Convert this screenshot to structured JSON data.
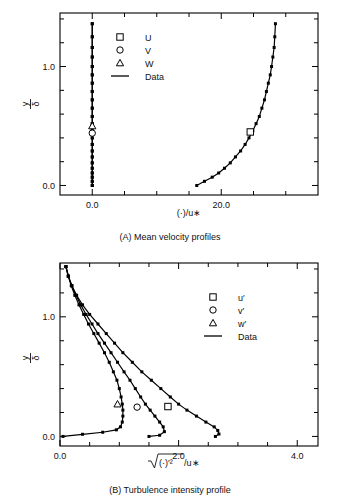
{
  "figure": {
    "background": "#ffffff",
    "ink": "#000000",
    "width": 340,
    "height": 503
  },
  "panels": [
    {
      "id": "A",
      "caption": "(A) Mean velocity profiles",
      "legend": [
        {
          "marker": "square",
          "label": "U"
        },
        {
          "marker": "circle",
          "label": "V"
        },
        {
          "marker": "triangle",
          "label": "W"
        },
        {
          "marker": "line",
          "label": "Data"
        }
      ],
      "chart_data": {
        "type": "line",
        "title": "(A) Mean velocity profiles",
        "xlabel": "(·)/u∗",
        "ylabel_num": "y",
        "ylabel_den": "δ",
        "xlim": [
          -5.0,
          35.0
        ],
        "ylim": [
          -0.08,
          1.45
        ],
        "xticks": [
          0.0,
          20.0
        ],
        "xticklabels": [
          "0.0",
          "20.0"
        ],
        "xminorticks": [
          5.0,
          10.0,
          15.0,
          25.0,
          30.0
        ],
        "yticks": [
          0.0,
          1.0
        ],
        "yticklabels": [
          "0.0",
          "1.0"
        ],
        "yminorticks": [
          0.2,
          0.4,
          0.6,
          0.8,
          1.2,
          1.4
        ],
        "grid": false,
        "legend_position": "upper-left-inside",
        "series": [
          {
            "name": "U",
            "marker": "square",
            "x": [
              16.2,
              17.4,
              18.6,
              19.6,
              20.5,
              21.4,
              22.2,
              23.0,
              23.7,
              24.3,
              24.9,
              25.4,
              25.9,
              26.3,
              26.7,
              27.0,
              27.3,
              27.6,
              27.8,
              28.0,
              28.2,
              28.3,
              28.4
            ],
            "y": [
              0.0,
              0.035,
              0.07,
              0.105,
              0.145,
              0.19,
              0.24,
              0.29,
              0.345,
              0.4,
              0.46,
              0.52,
              0.58,
              0.65,
              0.72,
              0.79,
              0.86,
              0.93,
              1.0,
              1.08,
              1.16,
              1.25,
              1.36
            ]
          },
          {
            "name": "V",
            "marker": "circle",
            "x": [
              0.0,
              0.0,
              0.0,
              0.0,
              0.0,
              0.0,
              0.0,
              0.0,
              0.0,
              0.0,
              0.0,
              0.0,
              0.0,
              0.0,
              0.0,
              0.0,
              0.0,
              0.0,
              0.0,
              0.0,
              0.0,
              0.0,
              0.0
            ],
            "y": [
              0.0,
              0.035,
              0.07,
              0.105,
              0.145,
              0.19,
              0.24,
              0.29,
              0.345,
              0.4,
              0.46,
              0.52,
              0.58,
              0.65,
              0.72,
              0.79,
              0.86,
              0.93,
              1.0,
              1.08,
              1.16,
              1.25,
              1.36
            ]
          },
          {
            "name": "W",
            "marker": "triangle",
            "x": [
              0.0,
              0.0,
              0.0,
              0.0,
              0.0,
              0.0,
              0.0,
              0.0,
              0.0,
              0.0,
              0.0,
              0.0,
              0.0,
              0.0,
              0.0,
              0.0,
              0.0,
              0.0,
              0.0,
              0.0,
              0.0,
              0.0,
              0.0
            ],
            "y": [
              0.0,
              0.035,
              0.07,
              0.105,
              0.145,
              0.19,
              0.24,
              0.29,
              0.345,
              0.4,
              0.46,
              0.52,
              0.58,
              0.65,
              0.72,
              0.79,
              0.86,
              0.93,
              1.0,
              1.08,
              1.16,
              1.25,
              1.36
            ]
          }
        ],
        "open_markers": [
          {
            "series": "U",
            "x": 24.5,
            "y": 0.45,
            "marker": "square"
          },
          {
            "series": "W",
            "x": 0.0,
            "y": 0.5,
            "marker": "triangle"
          },
          {
            "series": "V",
            "x": 0.0,
            "y": 0.44,
            "marker": "circle"
          }
        ]
      }
    },
    {
      "id": "B",
      "caption": "(B) Turbulence intensity profile",
      "legend": [
        {
          "marker": "square",
          "label": "u′"
        },
        {
          "marker": "circle",
          "label": "v′"
        },
        {
          "marker": "triangle",
          "label": "w′"
        },
        {
          "marker": "line",
          "label": "Data"
        }
      ],
      "chart_data": {
        "type": "line",
        "title": "(B) Turbulence intensity profile",
        "xlabel": "√(·)′²/u∗",
        "ylabel_num": "y",
        "ylabel_den": "δ",
        "xlim": [
          0.0,
          4.35
        ],
        "ylim": [
          -0.08,
          1.45
        ],
        "xticks": [
          0.0,
          2.0,
          4.0
        ],
        "xticklabels": [
          "0.0",
          "2.0",
          "4.0"
        ],
        "xminorticks": [
          0.5,
          1.0,
          1.5,
          2.5,
          3.0,
          3.5
        ],
        "yticks": [
          0.0,
          1.0
        ],
        "yticklabels": [
          "0.0",
          "1.0"
        ],
        "yminorticks": [
          0.2,
          0.4,
          0.6,
          0.8,
          1.2,
          1.4
        ],
        "grid": false,
        "legend_position": "upper-right-inside",
        "series": [
          {
            "name": "u′",
            "marker": "square",
            "x": [
              0.1,
              0.14,
              0.2,
              0.28,
              0.38,
              0.5,
              0.64,
              0.78,
              0.92,
              1.06,
              1.22,
              1.38,
              1.54,
              1.7,
              1.86,
              2.0,
              2.14,
              2.3,
              2.46,
              2.6,
              2.66,
              2.68,
              2.62
            ],
            "y": [
              1.42,
              1.34,
              1.26,
              1.18,
              1.1,
              1.02,
              0.94,
              0.86,
              0.78,
              0.7,
              0.62,
              0.54,
              0.47,
              0.4,
              0.33,
              0.27,
              0.22,
              0.17,
              0.12,
              0.08,
              0.05,
              0.02,
              0.0
            ]
          },
          {
            "name": "v′",
            "marker": "circle",
            "x": [
              0.1,
              0.14,
              0.2,
              0.27,
              0.35,
              0.44,
              0.54,
              0.64,
              0.75,
              0.86,
              0.97,
              1.08,
              1.18,
              1.27,
              1.36,
              1.44,
              1.52,
              1.6,
              1.68,
              1.74,
              1.76,
              1.68,
              1.5
            ],
            "y": [
              1.42,
              1.34,
              1.26,
              1.18,
              1.1,
              1.02,
              0.94,
              0.86,
              0.78,
              0.7,
              0.62,
              0.54,
              0.47,
              0.4,
              0.33,
              0.27,
              0.22,
              0.17,
              0.12,
              0.08,
              0.04,
              0.01,
              0.0
            ]
          },
          {
            "name": "w′",
            "marker": "triangle",
            "x": [
              0.1,
              0.14,
              0.19,
              0.25,
              0.32,
              0.4,
              0.48,
              0.57,
              0.66,
              0.75,
              0.83,
              0.9,
              0.96,
              1.0,
              1.03,
              1.05,
              1.06,
              1.06,
              1.05,
              1.02,
              0.95,
              0.72,
              0.38,
              0.05
            ],
            "y": [
              1.42,
              1.34,
              1.26,
              1.18,
              1.1,
              1.02,
              0.94,
              0.86,
              0.78,
              0.7,
              0.62,
              0.54,
              0.47,
              0.4,
              0.33,
              0.27,
              0.22,
              0.17,
              0.12,
              0.08,
              0.055,
              0.035,
              0.018,
              0.0
            ]
          }
        ],
        "open_markers": [
          {
            "series": "u′",
            "x": 1.82,
            "y": 0.25,
            "marker": "square"
          },
          {
            "series": "v′",
            "x": 1.3,
            "y": 0.245,
            "marker": "circle"
          },
          {
            "series": "w′",
            "x": 0.97,
            "y": 0.27,
            "marker": "triangle"
          }
        ]
      }
    }
  ]
}
